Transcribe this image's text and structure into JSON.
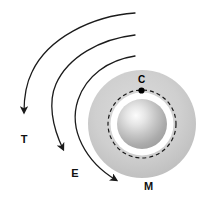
{
  "figure": {
    "title": "",
    "background_color": "#ffffff",
    "width": 216,
    "height": 222
  },
  "body": {
    "name": "central-body",
    "center": {
      "x": 142,
      "y": 124
    },
    "core": {
      "name": "core-sphere",
      "radius": 25,
      "highlight_color": "#fbfbfb",
      "mid_color": "#b9b9b9",
      "edge_color": "#a2a2a2"
    },
    "inner_ring": {
      "name": "white-annulus",
      "radius": 31,
      "color": "#ffffff"
    },
    "dashed_orbit": {
      "name": "dashed-orbit-circle",
      "radius": 34,
      "color": "#1a1a1a",
      "dash_pattern": "4 3",
      "stroke_width": 1.2
    },
    "outer_disc": {
      "name": "outer-halo-disc",
      "radius": 54,
      "fill_light": "#d6d6d6",
      "fill_dark": "#b4b4b4"
    }
  },
  "points": [
    {
      "id": "C",
      "label": "C",
      "name": "point-c",
      "x": 141.5,
      "y": 90.5,
      "dot_radius": 3,
      "color": "#000000",
      "label_dx": 0,
      "label_dy": -6
    }
  ],
  "trajectories": [
    {
      "id": "T",
      "label": "T",
      "name": "trajectory-t",
      "path": "M 135 13 C 92 16 48 38 32 72 C 26 84 24 98 24 110",
      "arrow_x": 24,
      "arrow_y": 126,
      "arrow_angle": 90,
      "label_x": 24,
      "label_y": 142,
      "stroke": "#1b1b1b",
      "stroke_width": 1.3
    },
    {
      "id": "E",
      "label": "E",
      "name": "trajectory-e",
      "path": "M 135 35 C 100 39 68 57 56 84 C 48 102 50 124 60 146",
      "arrow_x": 66,
      "arrow_y": 161,
      "arrow_angle": 63,
      "label_x": 73,
      "label_y": 176,
      "stroke": "#1b1b1b",
      "stroke_width": 1.3
    },
    {
      "id": "M",
      "label": "M",
      "name": "trajectory-m",
      "path": "M 135 56 C 108 60 86 76 78 100 C 68 128 82 159 110 176",
      "arrow_x": 128,
      "arrow_y": 185,
      "arrow_angle": 24,
      "label_x": 142,
      "label_y": 190,
      "stroke": "#1b1b1b",
      "stroke_width": 1.3
    }
  ],
  "legend": {
    "visible": false,
    "entries": []
  }
}
